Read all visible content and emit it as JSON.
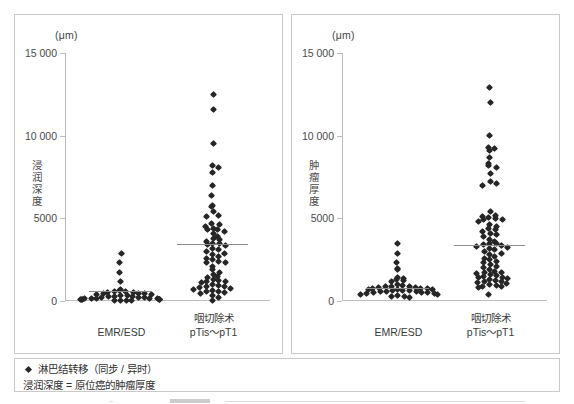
{
  "figure": {
    "footer": {
      "legend_marker": "diamond-marker",
      "legend_label": "淋巴结转移（同步 / 异时）",
      "footnote": "浸润深度 = 原位癌的肿瘤厚度"
    }
  },
  "chart_data": [
    {
      "type": "scatter",
      "title": "",
      "unit_label": "(μm)",
      "ylabel": "浸润深度",
      "xlabel": "",
      "ylim": [
        0,
        15000
      ],
      "yticks": [
        0,
        5000,
        10000,
        15000
      ],
      "ytick_labels": [
        "0",
        "5000",
        "10 000",
        "15 000"
      ],
      "grid": false,
      "legend_position": "below-figure",
      "categories": [
        "EMR/ESD",
        "咽切除术\npTis～pT1"
      ],
      "group_means": [
        600,
        3450
      ],
      "series": [
        {
          "name": "EMR/ESD",
          "values": [
            2900,
            2300,
            1750,
            1200,
            700,
            650,
            600,
            560,
            520,
            500,
            480,
            450,
            430,
            410,
            380,
            350,
            330,
            300,
            280,
            250,
            230,
            210,
            200,
            180,
            160,
            150,
            140,
            130,
            120,
            110,
            100,
            90,
            80,
            70,
            60,
            50,
            40,
            30
          ]
        },
        {
          "name": "咽切除术 pTis～pT1",
          "values": [
            12500,
            11600,
            9500,
            8200,
            8100,
            7800,
            7000,
            6400,
            5800,
            5700,
            5400,
            5200,
            5100,
            4700,
            4600,
            4500,
            4400,
            4350,
            4300,
            4200,
            4100,
            3900,
            3800,
            3700,
            3600,
            3500,
            3450,
            3400,
            3350,
            3200,
            3100,
            3000,
            2900,
            2800,
            2700,
            2600,
            2500,
            2400,
            2350,
            2300,
            2100,
            1900,
            1700,
            1600,
            1500,
            1400,
            1300,
            1250,
            1200,
            1150,
            1100,
            1000,
            950,
            900,
            850,
            800,
            750,
            700,
            650,
            600,
            550,
            500,
            450,
            350,
            200,
            60
          ]
        }
      ]
    },
    {
      "type": "scatter",
      "title": "",
      "unit_label": "(μm)",
      "ylabel": "肿瘤厚度",
      "xlabel": "",
      "ylim": [
        0,
        15000
      ],
      "yticks": [
        0,
        5000,
        10000,
        15000
      ],
      "ytick_labels": [
        "0",
        "5000",
        "10 000",
        "15 000"
      ],
      "grid": false,
      "legend_position": "below-figure",
      "categories": [
        "EMR/ESD",
        "咽切除术\npTis～pT1"
      ],
      "group_means": [
        800,
        3400
      ],
      "series": [
        {
          "name": "EMR/ESD",
          "values": [
            3500,
            2900,
            2350,
            1950,
            1900,
            1400,
            1350,
            1300,
            1250,
            1200,
            1000,
            950,
            900,
            880,
            850,
            820,
            800,
            780,
            760,
            740,
            720,
            700,
            680,
            660,
            640,
            620,
            600,
            580,
            560,
            540,
            520,
            500,
            480,
            450,
            420,
            400,
            350,
            300,
            250,
            200
          ]
        },
        {
          "name": "咽切除术 pTis～pT1",
          "values": [
            12900,
            12000,
            10000,
            9300,
            9200,
            9100,
            8700,
            8300,
            8200,
            8100,
            7700,
            7200,
            7100,
            7000,
            5400,
            5200,
            5100,
            5050,
            5000,
            4950,
            4900,
            4800,
            4600,
            4500,
            4400,
            4300,
            4200,
            4100,
            4000,
            3900,
            3700,
            3600,
            3500,
            3450,
            3400,
            3350,
            3300,
            3250,
            3200,
            3100,
            3000,
            2900,
            2800,
            2700,
            2600,
            2500,
            2400,
            2300,
            2200,
            2100,
            2000,
            1900,
            1800,
            1750,
            1700,
            1650,
            1600,
            1550,
            1500,
            1450,
            1400,
            1350,
            1300,
            1250,
            1200,
            1150,
            1100,
            1050,
            1000,
            950,
            900,
            850,
            800,
            400
          ]
        }
      ]
    }
  ]
}
